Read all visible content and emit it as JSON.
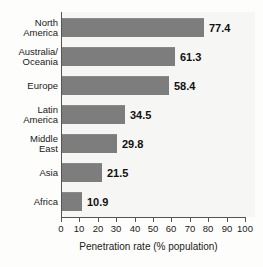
{
  "chart_data": {
    "type": "bar",
    "orientation": "horizontal",
    "title": "",
    "subtitle": "",
    "xlabel": "Penetration rate (% population)",
    "ylabel": "",
    "xlim": [
      0,
      100
    ],
    "xticks": [
      0,
      10,
      20,
      30,
      40,
      50,
      60,
      70,
      80,
      90,
      100
    ],
    "xtick_labels": [
      "0",
      "10",
      "20",
      "30",
      "40",
      "50",
      "60",
      "70",
      "80",
      "90",
      "100"
    ],
    "grid": false,
    "legend": null,
    "bar_color": "#7d7d7d",
    "plot_background": "#f6f6f4",
    "axis_color": "#555555",
    "categories": [
      "North\nAmerica",
      "Australia/\nOceania",
      "Europe",
      "Latin\nAmerica",
      "Middle\nEast",
      "Asia",
      "Africa"
    ],
    "values": [
      77.4,
      61.3,
      58.4,
      34.5,
      29.8,
      21.5,
      10.9
    ],
    "value_labels": [
      "77.4",
      "61.3",
      "58.4",
      "34.5",
      "29.8",
      "21.5",
      "10.9"
    ]
  }
}
